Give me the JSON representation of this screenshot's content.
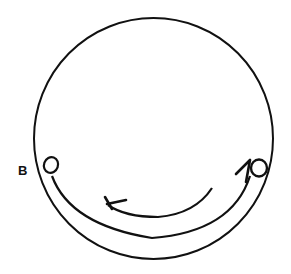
{
  "diagram": {
    "type": "circular-path-diagram",
    "labels": {
      "point_b": "B"
    },
    "elements": {
      "outer_circle": "closed circle",
      "inner_arc": "arc connecting left loop to right loop along bottom",
      "arrow_arc": "directional arc pointing right-to-left (counter-clockwise along bottom)",
      "left_loop": "small loop at point B",
      "right_loop": "small loop with tick mark on right side"
    },
    "colors": {
      "stroke": "#111111",
      "background": "#ffffff"
    }
  }
}
